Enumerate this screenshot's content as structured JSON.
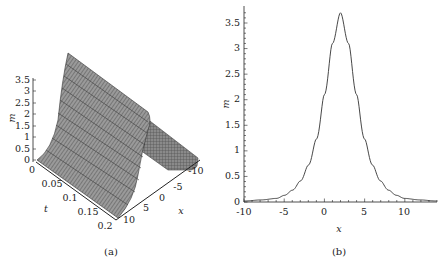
{
  "figure": {
    "panels": [
      {
        "caption": "(a)"
      },
      {
        "caption": "(b)"
      }
    ]
  },
  "chart_data": [
    {
      "type": "surface3d",
      "panel": "(a)",
      "title": "",
      "xlabel": "x",
      "ylabel": "t",
      "zlabel": "m",
      "x_ticks": [
        "-10",
        "-5",
        "0",
        "5",
        "10"
      ],
      "t_ticks": [
        "0",
        "0.05",
        "0.1",
        "0.15",
        "0.2"
      ],
      "z_ticks": [
        "0",
        "0.5",
        "1",
        "1.5",
        "2",
        "2.5",
        "3",
        "3.5"
      ],
      "x_range": [
        -10,
        12
      ],
      "t_range": [
        0,
        0.2
      ],
      "z_range": [
        0,
        3.7
      ],
      "description": "Single soliton ridge of height ~3.7 travelling along t, mesh-shaded gray surface"
    },
    {
      "type": "line",
      "panel": "(b)",
      "title": "",
      "xlabel": "x",
      "ylabel": "m",
      "xlim": [
        -10,
        14
      ],
      "ylim": [
        0,
        3.7
      ],
      "x_ticks": [
        "-10",
        "-5",
        "0",
        "5",
        "10"
      ],
      "y_ticks": [
        "0",
        "0.5",
        "1",
        "1.5",
        "2",
        "2.5",
        "3",
        "3.5"
      ],
      "grid": false,
      "x": [
        -10,
        -8,
        -6,
        -5,
        -4,
        -3,
        -2,
        -1,
        0,
        1,
        2,
        3,
        4,
        5,
        6,
        7,
        8,
        9,
        10,
        12,
        14
      ],
      "values": [
        0.02,
        0.04,
        0.07,
        0.13,
        0.23,
        0.41,
        0.72,
        1.23,
        2.1,
        3.1,
        3.7,
        3.1,
        2.1,
        1.23,
        0.72,
        0.41,
        0.23,
        0.13,
        0.07,
        0.04,
        0.02
      ]
    }
  ]
}
